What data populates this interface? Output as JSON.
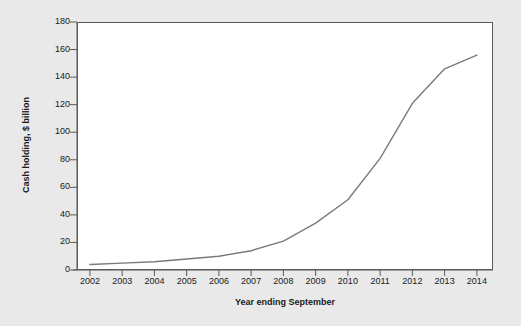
{
  "chart_data": {
    "type": "line",
    "title": "",
    "subtitle": "",
    "xlabel": "Year ending September",
    "ylabel": "Cash holding, $ billion",
    "x": [
      2002,
      2003,
      2004,
      2005,
      2006,
      2007,
      2008,
      2009,
      2010,
      2011,
      2012,
      2013,
      2014
    ],
    "values": [
      4,
      5,
      6,
      8,
      10,
      14,
      21,
      34,
      51,
      81,
      121,
      146,
      156
    ],
    "series": [
      {
        "name": "Cash holding",
        "values": [
          4,
          5,
          6,
          8,
          10,
          14,
          21,
          34,
          51,
          81,
          121,
          146,
          156
        ]
      }
    ],
    "xlim": [
      2001.6,
      2014.5
    ],
    "ylim": [
      0,
      180
    ],
    "ytick_labels": [
      "0",
      "20",
      "40",
      "60",
      "80",
      "100",
      "120",
      "140",
      "160",
      "180"
    ],
    "ytick_values": [
      0,
      20,
      40,
      60,
      80,
      100,
      120,
      140,
      160,
      180
    ],
    "xtick_labels": [
      "2002",
      "2003",
      "2004",
      "2005",
      "2006",
      "2007",
      "2008",
      "2009",
      "2010",
      "2011",
      "2012",
      "2013",
      "2014"
    ],
    "grid": false,
    "legend": "none",
    "line_color": "#7a7a7a",
    "plot_background": "#ffffff",
    "figure_background": "#e9e9e9",
    "axis_color": "#5a5a5a",
    "text_color": "#1a1a1a"
  }
}
